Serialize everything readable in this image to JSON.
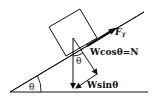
{
  "diagram": {
    "type": "inclined-plane-force-diagram",
    "labels": {
      "tension": "F",
      "tension_sub": "T",
      "normal_component": "Wcosθ=N",
      "parallel_component": "Wsinθ",
      "incline_angle": "θ",
      "weight_angle": "θ"
    },
    "colors": {
      "stroke": "#111111",
      "background": "#ffffff"
    }
  }
}
